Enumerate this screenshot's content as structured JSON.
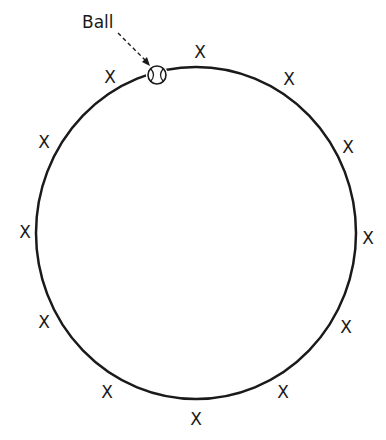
{
  "diagram": {
    "label": "Ball",
    "player_marker": "X",
    "colors": {
      "stroke": "#1a1a1a",
      "background": "#ffffff"
    },
    "circle": {
      "cx": 196,
      "cy": 233,
      "rx": 160,
      "ry": 166
    },
    "ball": {
      "cx": 157,
      "cy": 75,
      "r": 9
    },
    "players": [
      {
        "x": 200,
        "y": 52
      },
      {
        "x": 289,
        "y": 79
      },
      {
        "x": 348,
        "y": 147
      },
      {
        "x": 368,
        "y": 238
      },
      {
        "x": 346,
        "y": 327
      },
      {
        "x": 283,
        "y": 392
      },
      {
        "x": 196,
        "y": 419
      },
      {
        "x": 107,
        "y": 392
      },
      {
        "x": 44,
        "y": 322
      },
      {
        "x": 25,
        "y": 232
      },
      {
        "x": 44,
        "y": 142
      },
      {
        "x": 110,
        "y": 77
      }
    ]
  }
}
